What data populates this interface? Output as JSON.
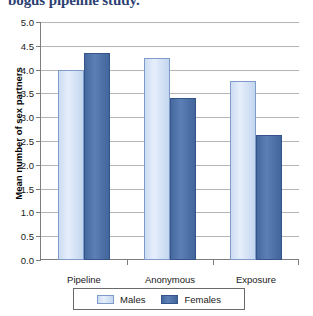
{
  "caption": {
    "text": "bogus pipeline study."
  },
  "chart_data": {
    "type": "bar",
    "title": "",
    "categories": [
      "Pipeline",
      "Anonymous",
      "Exposure"
    ],
    "series": [
      {
        "name": "Males",
        "color": "#cfdef4",
        "values": [
          4.0,
          4.25,
          3.77
        ]
      },
      {
        "name": "Females",
        "color": "#4a6fad",
        "values": [
          4.34,
          3.41,
          2.62
        ]
      }
    ],
    "xlabel": "",
    "ylabel": "Mean number of sex partners",
    "ylim": [
      0.0,
      5.0
    ],
    "yticks": [
      "0.0",
      "0.5",
      "1.0",
      "1.5",
      "2.0",
      "2.5",
      "3.0",
      "3.5",
      "4.0",
      "4.5",
      "5.0"
    ],
    "ytick_values": [
      0.0,
      0.5,
      1.0,
      1.5,
      2.0,
      2.5,
      3.0,
      3.5,
      4.0,
      4.5,
      5.0
    ],
    "grid": true,
    "legend_position": "bottom"
  }
}
